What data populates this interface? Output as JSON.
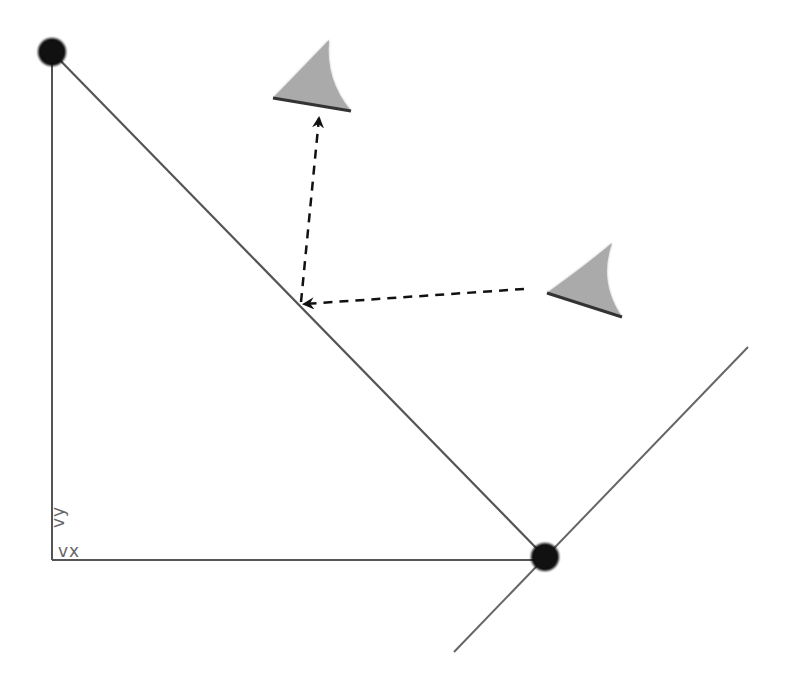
{
  "diagram": {
    "title": "",
    "colors": {
      "background": "#ffffff",
      "line": "#555555",
      "node": "#111111",
      "marker_fill": "#aaaaaa",
      "marker_edge": "#333333",
      "arrow": "#111111",
      "label": "#666666"
    },
    "nodes": [
      {
        "id": "top-left-node",
        "cx": 52,
        "cy": 52,
        "r": 12
      },
      {
        "id": "bottom-right-node",
        "cx": 545,
        "cy": 557,
        "r": 13
      }
    ],
    "lines": [
      {
        "id": "vertical-axis",
        "from": [
          52,
          52
        ],
        "to": [
          52,
          560
        ]
      },
      {
        "id": "horizontal-axis",
        "from": [
          52,
          560
        ],
        "to": [
          545,
          560
        ]
      },
      {
        "id": "hypotenuse",
        "from": [
          52,
          52
        ],
        "to": [
          545,
          557
        ]
      },
      {
        "id": "crossing-line",
        "from": [
          748,
          347
        ],
        "to": [
          454,
          652
        ]
      }
    ],
    "markers": [
      {
        "id": "upper-marker",
        "tip": [
          329,
          40
        ],
        "base_left": [
          273,
          98
        ],
        "base_right": [
          351,
          111
        ]
      },
      {
        "id": "right-marker",
        "tip": [
          612,
          243
        ],
        "base_left": [
          547,
          293
        ],
        "base_right": [
          622,
          317
        ]
      }
    ],
    "arrows": [
      {
        "id": "arrow-to-upper-marker",
        "style": "dashed",
        "from": [
          301,
          302
        ],
        "to": [
          319,
          118
        ]
      },
      {
        "id": "arrow-to-line-point",
        "style": "dashed",
        "from": [
          524,
          289
        ],
        "to": [
          304,
          304
        ]
      }
    ],
    "labels": {
      "vy": "vy",
      "vx": "vx"
    }
  }
}
